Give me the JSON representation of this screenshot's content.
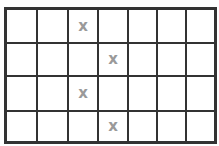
{
  "grid": {
    "rows": 4,
    "cols": 7,
    "mark_symbol": "x",
    "mark_color": "#9a9a9a",
    "line_color": "#333333",
    "cells": [
      [
        "",
        "",
        "x",
        "",
        "",
        "",
        ""
      ],
      [
        "",
        "",
        "",
        "x",
        "",
        "",
        ""
      ],
      [
        "",
        "",
        "x",
        "",
        "",
        "",
        ""
      ],
      [
        "",
        "",
        "",
        "x",
        "",
        "",
        ""
      ]
    ]
  }
}
